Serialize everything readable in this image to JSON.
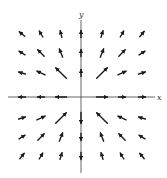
{
  "figure": {
    "type": "vector-field",
    "axes": {
      "x_label": "x",
      "y_label": "y",
      "origin_px": [
        81,
        97
      ],
      "x_range_px": [
        8,
        155
      ],
      "y_range_px": [
        20,
        173
      ]
    },
    "grid": {
      "columns_px": [
        22,
        41,
        61,
        81,
        102,
        122,
        142
      ],
      "rows_px": [
        34,
        53,
        73,
        97,
        118,
        137,
        156
      ],
      "math_coords": [
        -3,
        -2,
        -1,
        0,
        1,
        2,
        3
      ]
    },
    "field_rule": "F(x,y) direction: on axes points outward; off-axis aligned with diagonal (1,1) in Q1/Q3 and (-1,1) in Q2/Q4; longest near origin",
    "colors": {
      "arrow": "#1a1a1a",
      "axis": "#555555",
      "background": "#ffffff"
    }
  },
  "vectors": [
    {
      "x": -3,
      "y": 3,
      "dx": -1,
      "dy": 0.8,
      "len": 7
    },
    {
      "x": -2,
      "y": 3,
      "dx": -0.6,
      "dy": 1,
      "len": 7
    },
    {
      "x": -1,
      "y": 3,
      "dx": -0.25,
      "dy": 1,
      "len": 7
    },
    {
      "x": 0,
      "y": 3,
      "dx": 0,
      "dy": 1,
      "len": 7
    },
    {
      "x": 1,
      "y": 3,
      "dx": 0.3,
      "dy": 1,
      "len": 7
    },
    {
      "x": 2,
      "y": 3,
      "dx": 0.6,
      "dy": 1,
      "len": 7
    },
    {
      "x": 3,
      "y": 3,
      "dx": 0.8,
      "dy": 1,
      "len": 7
    },
    {
      "x": -3,
      "y": 2,
      "dx": -1,
      "dy": 0.6,
      "len": 7
    },
    {
      "x": -2,
      "y": 2,
      "dx": -1,
      "dy": 1,
      "len": 9
    },
    {
      "x": -1,
      "y": 2,
      "dx": -0.4,
      "dy": 1,
      "len": 9
    },
    {
      "x": 0,
      "y": 2,
      "dx": 0,
      "dy": 1,
      "len": 7
    },
    {
      "x": 1,
      "y": 2,
      "dx": 0.4,
      "dy": 1,
      "len": 9
    },
    {
      "x": 2,
      "y": 2,
      "dx": 1,
      "dy": 1,
      "len": 9
    },
    {
      "x": 3,
      "y": 2,
      "dx": 1,
      "dy": 0.6,
      "len": 7
    },
    {
      "x": -3,
      "y": 1,
      "dx": -1,
      "dy": 0.3,
      "len": 7
    },
    {
      "x": -2,
      "y": 1,
      "dx": -1,
      "dy": 0.45,
      "len": 9
    },
    {
      "x": -1,
      "y": 1,
      "dx": -1,
      "dy": 1,
      "len": 15
    },
    {
      "x": 0,
      "y": 1,
      "dx": 0,
      "dy": 1,
      "len": 7
    },
    {
      "x": 1,
      "y": 1,
      "dx": 1,
      "dy": 1,
      "len": 15
    },
    {
      "x": 2,
      "y": 1,
      "dx": 1,
      "dy": 0.45,
      "len": 9
    },
    {
      "x": 3,
      "y": 1,
      "dx": 1,
      "dy": 0.3,
      "len": 7
    },
    {
      "x": -3,
      "y": 0,
      "dx": -1,
      "dy": 0,
      "len": 7
    },
    {
      "x": -2,
      "y": 0,
      "dx": -1,
      "dy": 0,
      "len": 7
    },
    {
      "x": -1,
      "y": 0,
      "dx": -1,
      "dy": 0,
      "len": 11
    },
    {
      "x": 1,
      "y": 0,
      "dx": 1,
      "dy": 0,
      "len": 11
    },
    {
      "x": 2,
      "y": 0,
      "dx": 1,
      "dy": 0,
      "len": 7
    },
    {
      "x": 3,
      "y": 0,
      "dx": 1,
      "dy": 0,
      "len": 7
    },
    {
      "x": -3,
      "y": -1,
      "dx": 1,
      "dy": 0.3,
      "len": 7
    },
    {
      "x": -2,
      "y": -1,
      "dx": 1,
      "dy": 0.45,
      "len": 9
    },
    {
      "x": -1,
      "y": -1,
      "dx": 1,
      "dy": 1,
      "len": 15
    },
    {
      "x": 0,
      "y": -1,
      "dx": 0,
      "dy": -1,
      "len": 11
    },
    {
      "x": 1,
      "y": -1,
      "dx": -1,
      "dy": 1,
      "len": 15
    },
    {
      "x": 2,
      "y": -1,
      "dx": -1,
      "dy": 0.45,
      "len": 9
    },
    {
      "x": 3,
      "y": -1,
      "dx": -1,
      "dy": 0.3,
      "len": 7
    },
    {
      "x": -3,
      "y": -2,
      "dx": 1,
      "dy": 0.6,
      "len": 7
    },
    {
      "x": -2,
      "y": -2,
      "dx": 1,
      "dy": 1,
      "len": 9
    },
    {
      "x": -1,
      "y": -2,
      "dx": 0.4,
      "dy": 1,
      "len": 9
    },
    {
      "x": 0,
      "y": -2,
      "dx": 0,
      "dy": -1,
      "len": 7
    },
    {
      "x": 1,
      "y": -2,
      "dx": -0.4,
      "dy": 1,
      "len": 9
    },
    {
      "x": 2,
      "y": -2,
      "dx": -1,
      "dy": 1,
      "len": 9
    },
    {
      "x": 3,
      "y": -2,
      "dx": -1,
      "dy": 0.6,
      "len": 7
    },
    {
      "x": -3,
      "y": -3,
      "dx": 0.8,
      "dy": 1,
      "len": 7
    },
    {
      "x": -2,
      "y": -3,
      "dx": 0.6,
      "dy": 1,
      "len": 7
    },
    {
      "x": -1,
      "y": -3,
      "dx": 0.3,
      "dy": 1,
      "len": 7
    },
    {
      "x": 0,
      "y": -3,
      "dx": 0,
      "dy": -1,
      "len": 7
    },
    {
      "x": 1,
      "y": -3,
      "dx": -0.3,
      "dy": 1,
      "len": 7
    },
    {
      "x": 2,
      "y": -3,
      "dx": -0.6,
      "dy": 1,
      "len": 7
    },
    {
      "x": 3,
      "y": -3,
      "dx": -0.8,
      "dy": 1,
      "len": 7
    }
  ]
}
